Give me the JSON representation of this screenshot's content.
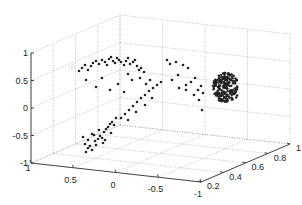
{
  "chart_data": {
    "type": "scatter",
    "dimensions": 3,
    "title": "",
    "xlabel": "",
    "ylabel": "",
    "zlabel": "",
    "xlim": [
      -1,
      1
    ],
    "ylim": [
      0.2,
      1
    ],
    "zlim": [
      -1,
      1
    ],
    "x_ticks": [
      "1",
      "0.5",
      "0",
      "-0.5",
      "-1"
    ],
    "y_ticks": [
      "0.2",
      "0.4",
      "0.6",
      "0.8",
      "1"
    ],
    "z_ticks": [
      "-1",
      "-0.5",
      "0",
      "0.5",
      "1"
    ],
    "grid": true,
    "legend": null,
    "marker_color": "#222222",
    "grid_color": "#9a9a9a",
    "series": [
      {
        "name": "scattered arc points",
        "description": "Sparse points forming an arc from the lower-left (z≈-0.6) up to the top (z≈0.7) and across toward the right cluster",
        "points_screen": [
          [
            86,
            152
          ],
          [
            88,
            148
          ],
          [
            90,
            146
          ],
          [
            92,
            150
          ],
          [
            85,
            144
          ],
          [
            95,
            141
          ],
          [
            98,
            139
          ],
          [
            100,
            136
          ],
          [
            102,
            138
          ],
          [
            96,
            145
          ],
          [
            94,
            135
          ],
          [
            104,
            132
          ],
          [
            106,
            129
          ],
          [
            108,
            127
          ],
          [
            110,
            124
          ],
          [
            112,
            122
          ],
          [
            114,
            125
          ],
          [
            116,
            118
          ],
          [
            111,
            133
          ],
          [
            105,
            140
          ],
          [
            83,
            137
          ],
          [
            88,
            140
          ],
          [
            92,
            134
          ],
          [
            99,
            130
          ],
          [
            103,
            143
          ],
          [
            79,
            71
          ],
          [
            82,
            68
          ],
          [
            85,
            65
          ],
          [
            88,
            70
          ],
          [
            91,
            66
          ],
          [
            93,
            63
          ],
          [
            96,
            61
          ],
          [
            99,
            64
          ],
          [
            102,
            60
          ],
          [
            105,
            62
          ],
          [
            107,
            65
          ],
          [
            109,
            59
          ],
          [
            111,
            57
          ],
          [
            113,
            61
          ],
          [
            115,
            63
          ],
          [
            117,
            58
          ],
          [
            119,
            60
          ],
          [
            121,
            62
          ],
          [
            124,
            65
          ],
          [
            126,
            61
          ],
          [
            128,
            58
          ],
          [
            130,
            64
          ],
          [
            133,
            62
          ],
          [
            135,
            60
          ],
          [
            137,
            66
          ],
          [
            139,
            70
          ],
          [
            141,
            68
          ],
          [
            144,
            72
          ],
          [
            86,
            80
          ],
          [
            96,
            87
          ],
          [
            102,
            78
          ],
          [
            110,
            90
          ],
          [
            118,
            84
          ],
          [
            124,
            92
          ],
          [
            128,
            74
          ],
          [
            132,
            80
          ],
          [
            140,
            78
          ],
          [
            146,
            84
          ],
          [
            150,
            80
          ],
          [
            121,
            118
          ],
          [
            125,
            114
          ],
          [
            129,
            110
          ],
          [
            133,
            106
          ],
          [
            137,
            102
          ],
          [
            141,
            98
          ],
          [
            145,
            95
          ],
          [
            149,
            91
          ],
          [
            153,
            88
          ],
          [
            157,
            85
          ],
          [
            161,
            82
          ],
          [
            152,
            98
          ],
          [
            145,
            105
          ],
          [
            136,
            112
          ],
          [
            128,
            120
          ],
          [
            167,
            60
          ],
          [
            170,
            64
          ],
          [
            176,
            62
          ],
          [
            183,
            65
          ],
          [
            188,
            68
          ],
          [
            178,
            75
          ],
          [
            172,
            80
          ],
          [
            179,
            88
          ],
          [
            186,
            85
          ],
          [
            191,
            82
          ],
          [
            195,
            78
          ],
          [
            198,
            90
          ],
          [
            201,
            86
          ],
          [
            203,
            93
          ],
          [
            199,
            100
          ],
          [
            202,
            110
          ],
          [
            194,
            95
          ],
          [
            186,
            90
          ]
        ]
      },
      {
        "name": "dense cluster",
        "description": "Dense clump of points near x≈-0.9, y≈0.6, z≈0.1 on the right side",
        "center_screen": [
          226,
          90
        ],
        "extent_screen": [
          213,
          70,
          238,
          102
        ]
      }
    ]
  }
}
